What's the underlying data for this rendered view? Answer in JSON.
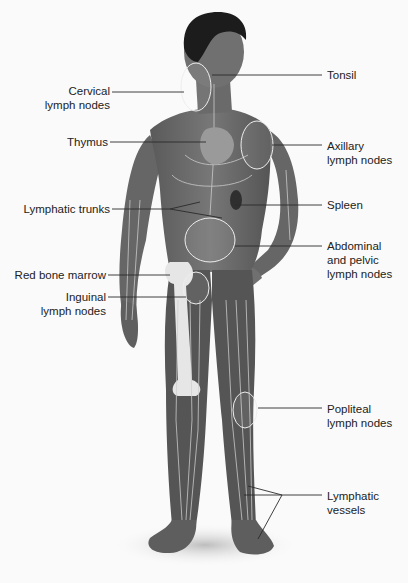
{
  "diagram": {
    "labels": {
      "cervical": [
        "Cervical",
        "lymph nodes"
      ],
      "thymus": [
        "Thymus"
      ],
      "lymphatic_trunks": [
        "Lymphatic trunks"
      ],
      "red_bone_marrow": [
        "Red bone marrow"
      ],
      "inguinal": [
        "Inguinal",
        "lymph nodes"
      ],
      "tonsil": [
        "Tonsil"
      ],
      "axillary": [
        "Axillary",
        "lymph nodes"
      ],
      "spleen": [
        "Spleen"
      ],
      "abdominal": [
        "Abdominal",
        "and pelvic",
        "lymph nodes"
      ],
      "popliteal": [
        "Popliteal",
        "lymph nodes"
      ],
      "lymphatic_vessels": [
        "Lymphatic",
        "vessels"
      ]
    },
    "colors": {
      "background": "#fafafa",
      "skin": "#6e6e6e",
      "skin_dark": "#4a4a4a",
      "hair": "#1c1c1c",
      "vessel": "#c9c9c9",
      "bone": "#e8e8e8",
      "leader": "#2a2a2a"
    }
  }
}
